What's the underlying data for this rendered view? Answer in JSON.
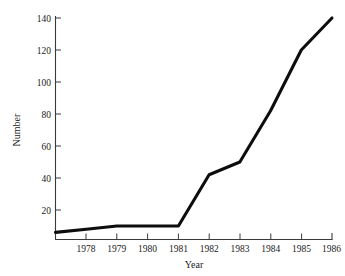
{
  "chart_data": {
    "type": "line",
    "title": "",
    "xlabel": "Year",
    "ylabel": "Number",
    "x": [
      1977,
      1978,
      1979,
      1980,
      1981,
      1982,
      1983,
      1984,
      1985,
      1986
    ],
    "values": [
      6,
      8,
      10,
      10,
      10,
      42,
      50,
      82,
      120,
      140
    ],
    "series": [
      {
        "name": "Number",
        "values": [
          6,
          8,
          10,
          10,
          10,
          42,
          50,
          82,
          120,
          140
        ]
      }
    ],
    "xtick_labels": [
      "1978",
      "1979",
      "1980",
      "1981",
      "1982",
      "1983",
      "1984",
      "1985",
      "1986"
    ],
    "xtick_values": [
      1978,
      1979,
      1980,
      1981,
      1982,
      1983,
      1984,
      1985,
      1986
    ],
    "ytick_labels": [
      "20",
      "40",
      "60",
      "80",
      "100",
      "120",
      "140"
    ],
    "ytick_values": [
      20,
      40,
      60,
      80,
      100,
      120,
      140
    ],
    "xlim": [
      1977,
      1986
    ],
    "ylim": [
      0,
      144
    ],
    "grid": false,
    "legend": false,
    "line_color": "#0d0d0d",
    "axis_color": "#3a3a3a",
    "background_color": "#ffffff"
  },
  "labels": {
    "y_axis_title": "Number",
    "x_axis_title": "Year",
    "y_140": "140",
    "y_120": "120",
    "y_100": "100",
    "y_80": "80",
    "y_60": "60",
    "y_40": "40",
    "y_20": "20",
    "x_1978": "1978",
    "x_1979": "1979",
    "x_1980": "1980",
    "x_1981": "1981",
    "x_1982": "1982",
    "x_1983": "1983",
    "x_1984": "1984",
    "x_1985": "1985",
    "x_1986": "1986"
  }
}
